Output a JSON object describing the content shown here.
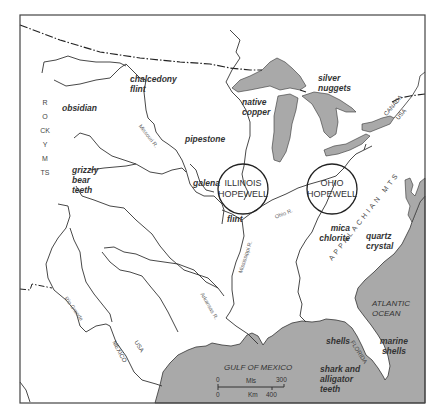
{
  "map": {
    "colors": {
      "water": "#a9a9a9",
      "land": "#ffffff",
      "line": "#333333",
      "frame": "#444444"
    },
    "sites": [
      {
        "id": "illinois",
        "line1": "ILLINOIS",
        "line2": "HOPEWELL"
      },
      {
        "id": "ohio",
        "line1": "OHIO",
        "line2": "HOPEWELL"
      }
    ],
    "resources": {
      "chalcedony": "chalcedony flint",
      "obsidian": "obsidian",
      "pipestone": "pipestone",
      "grizzly": [
        "grizzly",
        "bear",
        "teeth"
      ],
      "galena": "galena",
      "flint": "flint",
      "native_copper": [
        "native",
        "copper"
      ],
      "silver": [
        "silver",
        "nuggets"
      ],
      "mica": [
        "mica",
        "chlorite"
      ],
      "quartz": [
        "quartz",
        "crystal"
      ],
      "shells": "shells",
      "marine_shells": [
        "marine",
        "shells"
      ],
      "shark": [
        "shark and",
        "alligator",
        "teeth"
      ]
    },
    "chalcedony_lines": [
      "chalcedony",
      "flint"
    ],
    "rivers": {
      "missouri": "Missouri R.",
      "ohio": "Ohio R.",
      "mississippi": "Mississippi R.",
      "arkansas": "Arkansas R.",
      "rio_grande": "Rio Grande"
    },
    "mountains": {
      "rocky": "ROCKY MTS",
      "appalachian": "APPALACHIAN MTS"
    },
    "oceans": {
      "atlantic": [
        "ATLANTIC",
        "OCEAN"
      ],
      "gulf": "GULF OF MEXICO"
    },
    "regions": {
      "florida": "FLORIDA",
      "canada": "CANADA",
      "usa_north": "USA",
      "usa_south": "USA",
      "mexico": "MEXICO"
    },
    "scale": {
      "mls_label": "Mls",
      "km_label": "Km",
      "mls_zero": "0",
      "mls_max": "300",
      "km_zero": "0",
      "km_max": "400"
    }
  }
}
